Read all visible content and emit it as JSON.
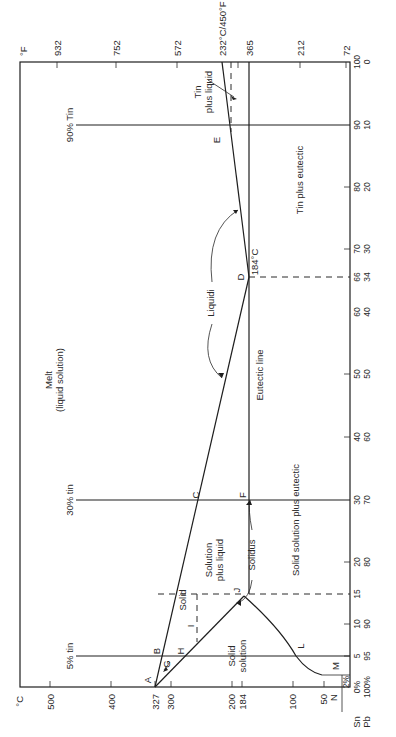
{
  "diagram": {
    "orientation": "rotated 90 degrees counter-clockwise",
    "axes": {
      "celsius": {
        "unit_label": "°C",
        "ticks": [
          "500",
          "400",
          "327",
          "300",
          "200",
          "184",
          "100",
          "50"
        ],
        "tick_values": [
          500,
          400,
          327,
          300,
          200,
          184,
          100,
          50
        ]
      },
      "fahrenheit": {
        "unit_label": "°F",
        "ticks": [
          "932",
          "752",
          "572",
          "232°C/450°F",
          "365",
          "212",
          "72"
        ]
      },
      "composition": {
        "sn_label": "Sn",
        "pb_label": "Pb",
        "ticks": [
          {
            "sn": "0%",
            "pb": "100%"
          },
          {
            "sn": "5",
            "pb": "95"
          },
          {
            "sn": "10",
            "pb": "90"
          },
          {
            "sn": "15",
            "pb": ""
          },
          {
            "sn": "20",
            "pb": "80"
          },
          {
            "sn": "30",
            "pb": "70"
          },
          {
            "sn": "40",
            "pb": "60"
          },
          {
            "sn": "50",
            "pb": "50"
          },
          {
            "sn": "60",
            "pb": "40"
          },
          {
            "sn": "66",
            "pb": "34"
          },
          {
            "sn": "70",
            "pb": "30"
          },
          {
            "sn": "80",
            "pb": "20"
          },
          {
            "sn": "90",
            "pb": "10"
          },
          {
            "sn": "100",
            "pb": "0"
          }
        ],
        "two_percent": "2%"
      }
    },
    "composition_lines": {
      "five": "5% tin",
      "thirty": "30% tin",
      "ninety": "90% Tin"
    },
    "points": {
      "A": "A",
      "B": "B",
      "C": "C",
      "D": "D",
      "E": "E",
      "F": "F",
      "G": "G",
      "H": "H",
      "I": "I",
      "J": "J",
      "L": "L",
      "M": "M",
      "N": "N"
    },
    "regions": {
      "melt_line1": "Melt",
      "melt_line2": "(liquid solution)",
      "solid": "Solid",
      "solution_line1": "Solution",
      "solution_line2": "plus liquid",
      "solid_solution_line1": "Solid",
      "solid_solution_line2": "solution",
      "solid_solution_eutectic": "Solid solution plus eutectic",
      "tin_eutectic": "Tin plus eutectic",
      "tin_liquid_line1": "Tin",
      "tin_liquid_line2": "plus liquid"
    },
    "annotations": {
      "liquidi": "Liquidi",
      "solidus": "Solidus",
      "eutectic_line": "Eutectic line",
      "eutectic_temp": "184°C"
    }
  }
}
